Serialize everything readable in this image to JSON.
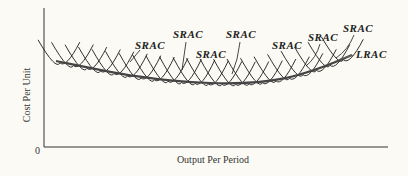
{
  "chart_data": {
    "type": "line",
    "title": "",
    "xlabel": "Output Per Period",
    "ylabel": "Cost Per Unit",
    "origin_label": "0",
    "grid": false,
    "legend": "none (curves labeled directly)",
    "series": [
      {
        "name": "LRAC",
        "kind": "long-run average cost envelope",
        "shape": "U-shaped, flat, minimum near middle-right of output range"
      },
      {
        "name": "SRAC",
        "kind": "short-run average cost curves",
        "count": "many (~22) overlapping U-shaped arcs tangent to LRAC"
      }
    ],
    "annotations": [
      {
        "text": "SRAC",
        "x": 135,
        "y": 45
      },
      {
        "text": "SRAC",
        "x": 173,
        "y": 35
      },
      {
        "text": "SRAC",
        "x": 196,
        "y": 54
      },
      {
        "text": "SRAC",
        "x": 226,
        "y": 35
      },
      {
        "text": "SRAC",
        "x": 272,
        "y": 45
      },
      {
        "text": "SRAC",
        "x": 308,
        "y": 37
      },
      {
        "text": "SRAC",
        "x": 343,
        "y": 29
      },
      {
        "text": "LRAC",
        "x": 356,
        "y": 54
      }
    ]
  },
  "labels": {
    "srac": "SRAC",
    "lrac": "LRAC",
    "xlabel": "Output Per Period",
    "ylabel": "Cost Per Unit",
    "origin": "0"
  }
}
